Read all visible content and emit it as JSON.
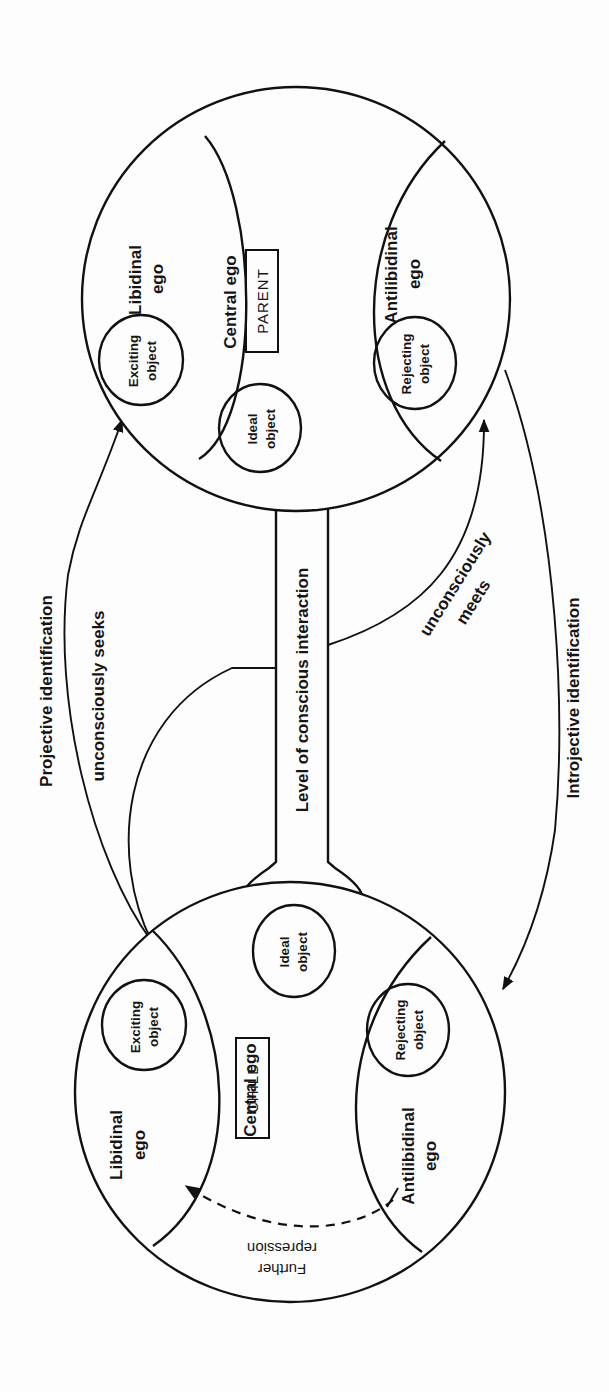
{
  "diagram": {
    "orientation": "rotated 90 degrees counter-clockwise",
    "parent_psyche": {
      "central_ego": "Central ego",
      "role": "PARENT",
      "libidinal_ego": [
        "Libidinal",
        "ego"
      ],
      "antilibidinal_ego": [
        "Antilibidinal",
        "ego"
      ],
      "exciting_object": [
        "Exciting",
        "object"
      ],
      "rejecting_object": [
        "Rejecting",
        "object"
      ],
      "ideal_object": [
        "Ideal",
        "object"
      ]
    },
    "child_psyche": {
      "central_ego": "Central ego",
      "role": "CHILD",
      "libidinal_ego": [
        "Libidinal",
        "ego"
      ],
      "antilibidinal_ego": [
        "Antilibidinal",
        "ego"
      ],
      "exciting_object": [
        "Exciting",
        "object"
      ],
      "rejecting_object": [
        "Rejecting",
        "object"
      ],
      "ideal_object": [
        "Ideal",
        "object"
      ],
      "further_repression": [
        "Further",
        "repression"
      ]
    },
    "connector": {
      "label": "Level of conscious interaction"
    },
    "arrows": {
      "projective": "Projective identification",
      "seeks": "unconsciously seeks",
      "meets": [
        "unconsciously",
        "meets"
      ],
      "introjective": "Introjective identification"
    }
  }
}
